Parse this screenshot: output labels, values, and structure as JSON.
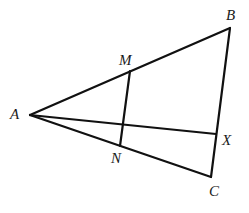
{
  "figure": {
    "type": "geometry-diagram",
    "stroke_color": "#111111",
    "label_color": "#1a1a1a",
    "background": "#ffffff"
  },
  "points": {
    "A": {
      "label": "A",
      "x": 30,
      "y": 115
    },
    "B": {
      "label": "B",
      "x": 230,
      "y": 28
    },
    "C": {
      "label": "C",
      "x": 211,
      "y": 177
    },
    "M": {
      "label": "M",
      "x": 130,
      "y": 71
    },
    "N": {
      "label": "N",
      "x": 120,
      "y": 146
    },
    "X": {
      "label": "X",
      "x": 216,
      "y": 134
    }
  },
  "segments": [
    {
      "from": "A",
      "to": "B"
    },
    {
      "from": "B",
      "to": "C"
    },
    {
      "from": "A",
      "to": "C"
    },
    {
      "from": "M",
      "to": "N"
    },
    {
      "from": "A",
      "to": "X"
    }
  ],
  "labels": {
    "A": "A",
    "B": "B",
    "C": "C",
    "M": "M",
    "N": "N",
    "X": "X"
  }
}
